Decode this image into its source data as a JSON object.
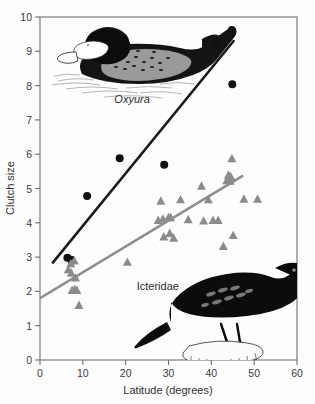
{
  "figure": {
    "background_color": "#fdfdfd"
  },
  "chart_data": {
    "type": "scatter",
    "title": "",
    "xlabel": "Latitude (degrees)",
    "ylabel": "Clutch size",
    "xlim": [
      0,
      60
    ],
    "ylim": [
      0,
      10
    ],
    "xticks": [
      0,
      10,
      20,
      30,
      40,
      50,
      60
    ],
    "yticks": [
      0,
      1,
      2,
      3,
      4,
      5,
      6,
      7,
      8,
      9,
      10
    ],
    "xtick_labels": [
      "0",
      "10",
      "20",
      "30",
      "40",
      "50",
      "60"
    ],
    "ytick_labels": [
      "0",
      "1",
      "2",
      "3",
      "4",
      "5",
      "6",
      "7",
      "8",
      "9",
      "10"
    ],
    "grid": false,
    "legend_position": "inline-annotations",
    "series": [
      {
        "name": "Oxyura",
        "marker": "circle",
        "color": "#111111",
        "label_style": "italic",
        "points": [
          [
            6.4,
            2.98
          ],
          [
            7.3,
            2.92
          ],
          [
            11.0,
            4.78
          ],
          [
            18.6,
            5.88
          ],
          [
            29.0,
            5.69
          ],
          [
            41.0,
            9.12
          ],
          [
            44.8,
            9.62
          ],
          [
            44.9,
            8.04
          ]
        ],
        "fit_line": {
          "x_start": 3.0,
          "y_start": 2.84,
          "x_end": 45.2,
          "y_end": 9.3,
          "color": "#1a1a1a"
        }
      },
      {
        "name": "Icteridae",
        "marker": "triangle",
        "color": "#8b8b8e",
        "label_style": "normal",
        "points": [
          [
            6.6,
            2.62
          ],
          [
            7.2,
            2.8
          ],
          [
            7.3,
            2.52
          ],
          [
            7.5,
            2.02
          ],
          [
            8.0,
            2.88
          ],
          [
            8.1,
            2.04
          ],
          [
            8.3,
            2.38
          ],
          [
            8.6,
            2.02
          ],
          [
            9.1,
            1.58
          ],
          [
            20.4,
            2.84
          ],
          [
            27.6,
            4.06
          ],
          [
            28.7,
            4.1
          ],
          [
            28.9,
            3.58
          ],
          [
            30.0,
            4.14
          ],
          [
            30.3,
            3.68
          ],
          [
            30.5,
            4.14
          ],
          [
            31.2,
            3.54
          ],
          [
            28.2,
            4.62
          ],
          [
            32.8,
            4.66
          ],
          [
            34.6,
            4.08
          ],
          [
            37.7,
            5.06
          ],
          [
            38.2,
            4.04
          ],
          [
            39.3,
            4.66
          ],
          [
            40.4,
            4.06
          ],
          [
            41.6,
            4.06
          ],
          [
            42.8,
            3.3
          ],
          [
            43.6,
            5.22
          ],
          [
            44.0,
            5.38
          ],
          [
            44.4,
            5.2
          ],
          [
            44.5,
            5.34
          ],
          [
            44.8,
            5.86
          ],
          [
            45.1,
            3.62
          ],
          [
            47.6,
            4.68
          ],
          [
            50.8,
            4.68
          ]
        ],
        "fit_line": {
          "x_start": 0.0,
          "y_start": 1.8,
          "x_end": 47.2,
          "y_end": 5.36,
          "color": "#8e8e91"
        }
      }
    ],
    "annotations": [
      {
        "text": "Oxyura",
        "x": 21.5,
        "y": 7.48,
        "style": "italic"
      },
      {
        "text": "Icteridae",
        "x": 27.5,
        "y": 2.05,
        "style": "normal"
      }
    ],
    "illustrations": [
      {
        "name": "ruddy-duck-illustration",
        "subject": "Oxyura duck"
      },
      {
        "name": "blackbird-illustration",
        "subject": "Icteridae blackbird on post"
      }
    ]
  }
}
